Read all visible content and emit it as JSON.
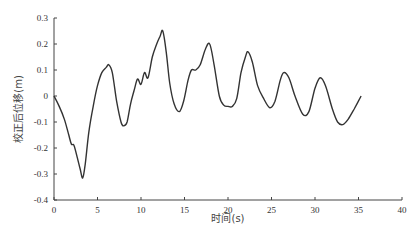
{
  "chart_data": {
    "type": "line",
    "title": "",
    "xlabel": "时间(s)",
    "ylabel": "校正后位移(m)",
    "xlim": [
      0,
      40
    ],
    "ylim": [
      -0.4,
      0.3
    ],
    "xticks": [
      0,
      5,
      10,
      15,
      20,
      25,
      30,
      35,
      40
    ],
    "yticks": [
      0.3,
      0.2,
      0.1,
      0,
      -0.1,
      -0.2,
      -0.3,
      -0.4
    ],
    "xtick_labels": [
      "0",
      "5",
      "10",
      "15",
      "20",
      "25",
      "30",
      "35",
      "40"
    ],
    "ytick_labels": [
      "0.3",
      "0.2",
      "0.1",
      "0",
      "-0.1",
      "-0.2",
      "-0.3",
      "-0.4"
    ],
    "grid": false,
    "legend": null,
    "series": [
      {
        "name": "校正后位移",
        "color": "#333333",
        "x": [
          0,
          0.6,
          1.2,
          1.7,
          2.0,
          2.3,
          2.7,
          3.0,
          3.3,
          3.6,
          4.0,
          4.5,
          5.0,
          5.5,
          6.0,
          6.3,
          6.7,
          7.2,
          7.7,
          8.0,
          8.4,
          8.8,
          9.2,
          9.6,
          10.0,
          10.4,
          10.8,
          11.3,
          11.8,
          12.2,
          12.5,
          12.9,
          13.3,
          13.8,
          14.4,
          14.9,
          15.4,
          15.8,
          16.3,
          16.8,
          17.4,
          17.9,
          18.4,
          19.0,
          19.5,
          20.0,
          20.5,
          21.0,
          21.5,
          22.0,
          22.3,
          22.8,
          23.4,
          24.1,
          24.8,
          25.4,
          26.0,
          26.4,
          27.0,
          27.7,
          28.6,
          29.3,
          30.0,
          30.6,
          31.2,
          32.0,
          32.6,
          33.2,
          33.8,
          34.5,
          35.3
        ],
        "values": [
          0,
          -0.04,
          -0.09,
          -0.15,
          -0.185,
          -0.19,
          -0.24,
          -0.28,
          -0.315,
          -0.26,
          -0.14,
          -0.04,
          0.04,
          0.09,
          0.11,
          0.12,
          0.09,
          -0.02,
          -0.1,
          -0.115,
          -0.1,
          -0.03,
          0.02,
          0.065,
          0.045,
          0.09,
          0.07,
          0.15,
          0.2,
          0.23,
          0.25,
          0.17,
          0.05,
          -0.03,
          -0.06,
          -0.02,
          0.06,
          0.1,
          0.1,
          0.12,
          0.18,
          0.2,
          0.12,
          0.0,
          -0.035,
          -0.04,
          -0.04,
          -0.01,
          0.09,
          0.15,
          0.17,
          0.13,
          0.04,
          -0.01,
          -0.045,
          -0.02,
          0.06,
          0.09,
          0.07,
          0.0,
          -0.07,
          -0.06,
          0.03,
          0.07,
          0.04,
          -0.05,
          -0.1,
          -0.11,
          -0.09,
          -0.05,
          0.0
        ]
      }
    ]
  }
}
